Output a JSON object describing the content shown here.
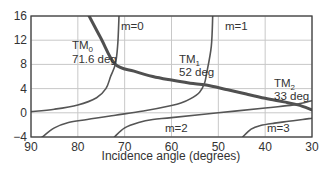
{
  "chart_data": {
    "type": "line",
    "title": "",
    "xlabel": "Incidence angle (degrees)",
    "ylabel": "",
    "xlim": [
      90,
      30
    ],
    "ylim": [
      -4,
      16
    ],
    "x_reversed": true,
    "grid": true,
    "x_ticks": [
      "90",
      "80",
      "70",
      "60",
      "50",
      "40",
      "30"
    ],
    "y_ticks": [
      "16",
      "12",
      "8",
      "4",
      "0",
      "-4"
    ],
    "x_tick_values": [
      90,
      80,
      70,
      60,
      50,
      40,
      30
    ],
    "y_tick_values": [
      16,
      12,
      8,
      4,
      0,
      -4
    ],
    "series": [
      {
        "name": "decreasing curve (thick)",
        "style": "thick",
        "x": [
          77.6,
          75,
          72,
          68,
          64,
          60,
          56,
          52.6,
          48,
          44,
          40,
          36,
          33,
          30
        ],
        "y": [
          16,
          12.2,
          8.0,
          6.9,
          6.0,
          5.4,
          4.9,
          4.6,
          3.8,
          3.1,
          2.4,
          1.8,
          1.3,
          0.5
        ]
      },
      {
        "name": "m=0",
        "x": [
          90,
          85,
          80,
          76,
          74,
          73,
          72,
          71.5,
          71.2
        ],
        "y": [
          0.2,
          0.6,
          1.3,
          2.5,
          4.0,
          6.0,
          8.0,
          11.0,
          16.0
        ]
      },
      {
        "name": "m=1",
        "x": [
          87.6,
          85,
          82,
          78,
          72,
          66,
          60,
          58,
          56,
          54,
          53,
          52.5,
          51.5,
          51.2
        ],
        "y": [
          -4.0,
          -2.5,
          -1.6,
          -1.1,
          -0.4,
          0.3,
          1.2,
          1.6,
          2.3,
          3.4,
          4.8,
          6.5,
          11.0,
          16.0
        ]
      },
      {
        "name": "m=2",
        "x": [
          72.2,
          70,
          67,
          64,
          60,
          50,
          40,
          34,
          30
        ],
        "y": [
          -4.0,
          -2.5,
          -1.6,
          -1.1,
          -0.8,
          0.0,
          0.8,
          1.3,
          2.0
        ]
      },
      {
        "name": "m=3",
        "x": [
          44.8,
          43,
          41,
          38,
          35,
          32,
          30
        ],
        "y": [
          -4.0,
          -2.7,
          -2.1,
          -1.7,
          -1.4,
          -1.1,
          -0.9
        ]
      }
    ],
    "annotations": [
      {
        "text": "m=0",
        "x": 70,
        "y": 14.5
      },
      {
        "text": "m=1",
        "x": 50,
        "y": 14.5
      },
      {
        "text": "m=2",
        "x": 62,
        "y": -2.7
      },
      {
        "text": "m=3",
        "x": 40,
        "y": -2.7
      },
      {
        "text": "TM0 71.6 deg",
        "main": "TM",
        "sub": "0",
        "value": "71.6 deg",
        "x": 78,
        "y": 10
      },
      {
        "text": "TM1 52 deg",
        "main": "TM",
        "sub": "1",
        "value": "52 deg",
        "x": 58,
        "y": 7
      },
      {
        "text": "TM2 33 deg",
        "main": "TM",
        "sub": "2",
        "value": "33 deg",
        "x": 37,
        "y": 3
      }
    ]
  },
  "labels": {
    "xlabel": "Incidence angle (degrees)",
    "m0": "m=0",
    "m1": "m=1",
    "m2": "m=2",
    "m3": "m=3",
    "tm0_main": "TM",
    "tm0_sub": "0",
    "tm0_value": "71.6 deg",
    "tm1_main": "TM",
    "tm1_sub": "1",
    "tm1_value": "52 deg",
    "tm2_main": "TM",
    "tm2_sub": "2",
    "tm2_value": "33 deg"
  },
  "colors": {
    "curve": "#555555",
    "thick_curve": "#505050",
    "grid": "#c8c8c8",
    "frame": "#404040",
    "text": "#333333"
  }
}
